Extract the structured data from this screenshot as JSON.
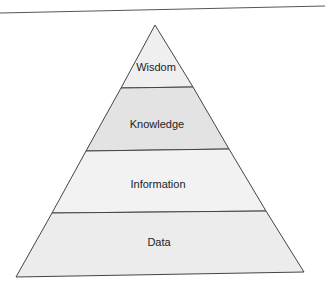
{
  "diagram": {
    "levels": [
      {
        "label": "Wisdom",
        "fill": "#efefef"
      },
      {
        "label": "Knowledge",
        "fill": "#e3e3e3"
      },
      {
        "label": "Information",
        "fill": "#f2f2f2"
      },
      {
        "label": "Data",
        "fill": "#ececec"
      }
    ],
    "stroke": "#444444"
  }
}
